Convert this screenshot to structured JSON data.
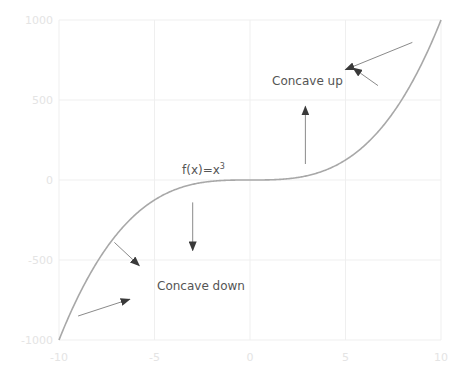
{
  "chart_data": {
    "type": "line",
    "title": "",
    "xlabel": "",
    "ylabel": "",
    "xlim": [
      -10,
      10
    ],
    "ylim": [
      -1000,
      1000
    ],
    "grid": true,
    "legend": "none",
    "x_ticks": [
      "-10",
      "-5",
      "0",
      "5",
      "10"
    ],
    "y_ticks": [
      "1000",
      "500",
      "0",
      "-500",
      "-1000"
    ],
    "series": [
      {
        "name": "f(x)=x^3",
        "function": "x^3",
        "x": [
          -10,
          -9,
          -8,
          -7,
          -6,
          -5,
          -4,
          -3,
          -2,
          -1,
          0,
          1,
          2,
          3,
          4,
          5,
          6,
          7,
          8,
          9,
          10
        ],
        "values": [
          -1000,
          -729,
          -512,
          -343,
          -216,
          -125,
          -64,
          -27,
          -8,
          -1,
          0,
          1,
          8,
          27,
          64,
          125,
          216,
          343,
          512,
          729,
          1000
        ]
      }
    ],
    "annotations": [
      {
        "text": "f(x)=x",
        "superscript": "3",
        "x": -2.2,
        "y": 30
      },
      {
        "text": "Concave up",
        "x": 2.6,
        "y": 620
      },
      {
        "text": "Concave down",
        "x": -3.4,
        "y": -640
      }
    ],
    "arrows": [
      {
        "from": [
          8.5,
          860
        ],
        "to": [
          5.0,
          690
        ],
        "label": "upper-right-arrow"
      },
      {
        "from": [
          6.7,
          590
        ],
        "to": [
          5.4,
          700
        ],
        "label": "mid-right-arrow"
      },
      {
        "from": [
          2.9,
          100
        ],
        "to": [
          2.9,
          460
        ],
        "label": "up-arrow"
      },
      {
        "from": [
          -3.0,
          -140
        ],
        "to": [
          -3.0,
          -440
        ],
        "label": "down-arrow"
      },
      {
        "from": [
          -7.1,
          -390
        ],
        "to": [
          -5.8,
          -535
        ],
        "label": "lower-left-diagonal-arrow"
      },
      {
        "from": [
          -9.0,
          -850
        ],
        "to": [
          -6.3,
          -745
        ],
        "label": "lower-left-arrow"
      }
    ]
  },
  "labels": {
    "fn_main": "f(x)=x",
    "fn_sup": "3",
    "concave_up": "Concave up",
    "concave_down": "Concave down"
  },
  "ticks": {
    "x": [
      "-10",
      "-5",
      "0",
      "5",
      "10"
    ],
    "y": [
      "1000",
      "500",
      "0",
      "-500",
      "-1000"
    ]
  },
  "colors": {
    "curve": "#a8a8a8",
    "grid": "#efefef",
    "tick_text": "#e4e4e4",
    "annotation_text": "#555555",
    "arrow": "#8a8a8a"
  }
}
